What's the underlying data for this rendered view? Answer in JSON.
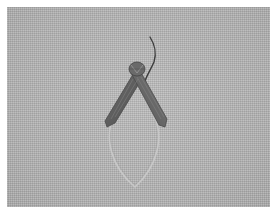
{
  "image": {
    "alt": "Grayscale photo of a small moth with wings folded in an inverted V shape, resting on textured light-gray fabric, with a faint pale leaf-shaped outline below it and a thin curved antenna above",
    "subject": "moth",
    "background": "textured gray fabric",
    "colors": {
      "background": "#b4b4b4",
      "margin": "#ffffff",
      "wing_dark": "#5a5a5a",
      "wing_mid": "#7a7a7a",
      "outline_pale": "#c8c8c8"
    }
  }
}
